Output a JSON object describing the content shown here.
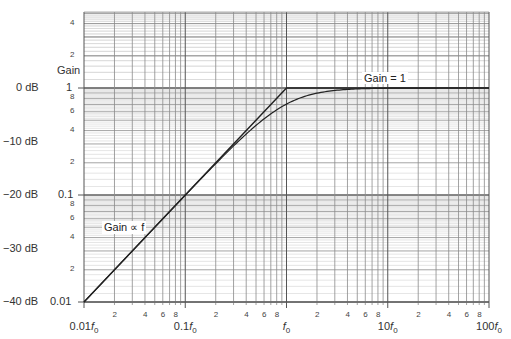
{
  "chart_data": {
    "type": "line",
    "title": "",
    "xscale": "log",
    "yscale": "log",
    "xlabel": "",
    "ylabel": "Gain",
    "xlim": [
      0.01,
      100
    ],
    "ylim": [
      0.01,
      5
    ],
    "grid": true,
    "x_major_ticks": [
      {
        "value": 0.01,
        "label": "0.01f",
        "sub": "0"
      },
      {
        "value": 0.1,
        "label": "0.1f",
        "sub": "0"
      },
      {
        "value": 1,
        "label": "f",
        "sub": "0"
      },
      {
        "value": 10,
        "label": "10f",
        "sub": "0"
      },
      {
        "value": 100,
        "label": "100f",
        "sub": "0"
      }
    ],
    "x_minor_tick_labels": [
      "2",
      "4",
      "6",
      "8"
    ],
    "y_major_ticks": [
      {
        "value": 1,
        "label": "1",
        "db": "0 dB"
      },
      {
        "value": 0.1,
        "label": "0.1",
        "db": "−20 dB"
      },
      {
        "value": 0.01,
        "label": "0.01",
        "db": "−40 dB"
      }
    ],
    "y_db_only_ticks": [
      {
        "value": 0.3162,
        "db": "−10 dB"
      },
      {
        "value": 0.03162,
        "db": "−30 dB"
      }
    ],
    "y_minor_tick_labels": [
      "2",
      "4",
      "6",
      "8"
    ],
    "series": [
      {
        "name": "Asymptote",
        "x": [
          0.01,
          1,
          100
        ],
        "y": [
          0.01,
          1,
          1
        ]
      },
      {
        "name": "Actual response",
        "formula": "f/sqrt(1+f^2)",
        "x": [
          0.01,
          0.1,
          0.3,
          0.5,
          1,
          2,
          4,
          10,
          100
        ],
        "y": [
          0.01,
          0.0995,
          0.287,
          0.447,
          0.707,
          0.894,
          0.97,
          0.995,
          1.0
        ]
      }
    ],
    "annotations": [
      {
        "text": "Gain = 1",
        "x": 4.5,
        "y": 1.35
      },
      {
        "text": "Gain ∝ f",
        "x": 0.03,
        "y": 0.05
      }
    ]
  },
  "labels": {
    "gain_axis_title": "Gain",
    "gain_eq_1": "Gain = 1",
    "gain_prop_f": "Gain ∝ f"
  }
}
